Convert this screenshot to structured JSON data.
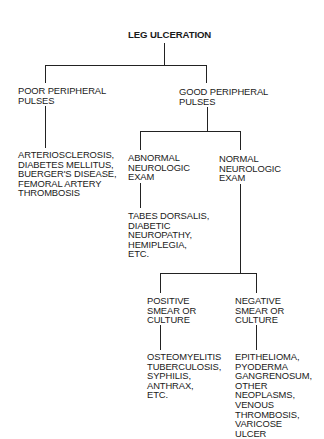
{
  "diagram": {
    "root": "LEG ULCERATION",
    "poor_pulses": "POOR PERIPHERAL\nPULSES",
    "poor_pulses_causes": "ARTERIOSCLEROSIS,\nDIABETES MELLITUS,\nBUERGER'S DISEASE,\nFEMORAL ARTERY\nTHROMBOSIS",
    "good_pulses": "GOOD PERIPHERAL\nPULSES",
    "abnormal_neuro": "ABNORMAL\nNEUROLOGIC\nEXAM",
    "abnormal_neuro_causes": "TABES DORSALIS,\nDIABETIC\nNEUROPATHY,\nHEMIPLEGIA,\nETC.",
    "normal_neuro": "NORMAL\nNEUROLOGIC\nEXAM",
    "positive_smear": "POSITIVE\nSMEAR OR\nCULTURE",
    "positive_smear_causes": "OSTEOMYELITIS\nTUBERCULOSIS,\nSYPHILIS,\nANTHRAX,\nETC.",
    "negative_smear": "NEGATIVE\nSMEAR OR\nCULTURE",
    "negative_smear_causes": "EPITHELIOMA,\nPYODERMA\nGANGRENOSUM,\nOTHER\nNEOPLASMS,\nVENOUS\nTHROMBOSIS,\nVARICOSE\nULCER"
  }
}
